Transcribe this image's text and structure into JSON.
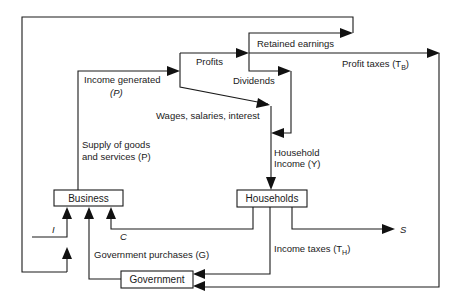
{
  "diagram": {
    "nodes": {
      "business": "Business",
      "households": "Households",
      "government": "Government"
    },
    "flows": {
      "income_generated": "Income generated",
      "income_generated_sym": "(P)",
      "profits": "Profits",
      "retained_earnings": "Retained earnings",
      "dividends": "Dividends",
      "profit_taxes": "Profit taxes (T",
      "profit_taxes_sub": "B",
      "profit_taxes_close": ")",
      "wages": "Wages, salaries, interest",
      "supply_line1": "Supply of goods",
      "supply_line2": "and services (P)",
      "household_income_line1": "Household",
      "household_income_line2": "Income (Y)",
      "investment": "I",
      "consumption": "C",
      "government_purchases": "Government purchases (G)",
      "income_taxes": "Income taxes (T",
      "income_taxes_sub": "H",
      "income_taxes_close": ")",
      "savings": "S"
    }
  }
}
